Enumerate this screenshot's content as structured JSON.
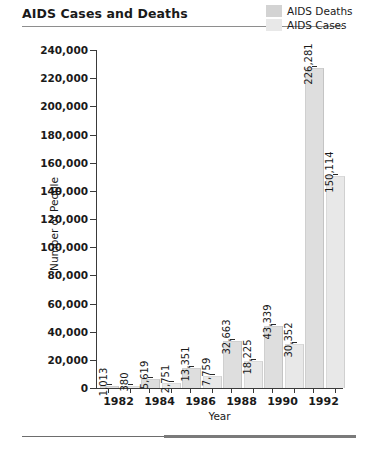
{
  "title": "AIDS Cases and Deaths",
  "legend": [
    {
      "label": "AIDS Deaths",
      "color": "#d3d3d3"
    },
    {
      "label": "AIDS Cases",
      "color": "#e8e8e8"
    }
  ],
  "chart_data": {
    "type": "bar",
    "title": "AIDS Cases and Deaths",
    "xlabel": "Year",
    "ylabel": "Number of People",
    "categories": [
      "1982",
      "1984",
      "1986",
      "1988",
      "1990",
      "1992"
    ],
    "series": [
      {
        "name": "AIDS Deaths",
        "color": "#d3d3d3",
        "values": [
          1013,
          5619,
          13351,
          32663,
          43339,
          226281
        ],
        "labels": [
          "1,013",
          "5,619",
          "13,351",
          "32,663",
          "43,339",
          "226,281"
        ]
      },
      {
        "name": "AIDS Cases",
        "color": "#e8e8e8",
        "values": [
          380,
          2751,
          7759,
          18225,
          30352,
          150114
        ],
        "labels": [
          "380",
          "2,751",
          "7,759",
          "18,225",
          "30,352",
          "150,114"
        ]
      }
    ],
    "ylim": [
      0,
      240000
    ],
    "ytick_labels": [
      "240,000",
      "220,000",
      "200,000",
      "180,000",
      "160,000",
      "140,000",
      "120,000",
      "100,000",
      "80,000",
      "60,000",
      "40,000",
      "20,000",
      "0"
    ],
    "ytick_values": [
      240000,
      220000,
      200000,
      180000,
      160000,
      140000,
      120000,
      100000,
      80000,
      60000,
      40000,
      20000,
      0
    ],
    "grid": false,
    "legend_position": "top-right"
  }
}
